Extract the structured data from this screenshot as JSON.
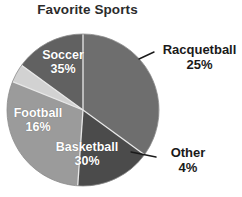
{
  "chart_data": {
    "type": "pie",
    "title": "Favorite Sports",
    "xlabel": "",
    "ylabel": "",
    "legend": "none",
    "grid": false,
    "categories": [
      "Soccer",
      "Racquetball",
      "Other",
      "Basketball",
      "Football"
    ],
    "values": [
      35,
      25,
      4,
      30,
      16
    ],
    "value_unit": "%",
    "slices": [
      {
        "name": "Soccer",
        "value": 35,
        "label": "Soccer",
        "percent_label": "35%",
        "color": "#6e6e6e",
        "label_color": "#ffffff",
        "label_placement": "inside",
        "start_angle": 0,
        "end_angle": 126
      },
      {
        "name": "Racquetball",
        "value": 25,
        "label": "Racquetball",
        "percent_label": "25%",
        "color": "#616161",
        "label_color": "#1a1a1a",
        "label_placement": "outside",
        "start_angle": 306,
        "end_angle": 360
      },
      {
        "name": "Other",
        "value": 4,
        "label": "Other",
        "percent_label": "4%",
        "color": "#d2d2d2",
        "label_color": "#1a1a1a",
        "label_placement": "outside",
        "start_angle": 292,
        "end_angle": 306
      },
      {
        "name": "Basketball",
        "value": 30,
        "label": "Basketball",
        "percent_label": "30%",
        "color": "#9b9b9b",
        "label_color": "#ffffff",
        "label_placement": "inside",
        "start_angle": 184,
        "end_angle": 292
      },
      {
        "name": "Football",
        "value": 16,
        "label": "Football",
        "percent_label": "16%",
        "color": "#4b4b4b",
        "label_color": "#ffffff",
        "label_placement": "inside",
        "start_angle": 126,
        "end_angle": 184
      }
    ],
    "geometry": {
      "center_x": 83,
      "center_y": 110,
      "radius": 76
    },
    "leader_lines": [
      {
        "for": "Racquetball",
        "x1": 139,
        "y1": 59,
        "x2": 154,
        "y2": 52
      },
      {
        "for": "Other",
        "x1": 131,
        "y1": 152,
        "x2": 156,
        "y2": 157
      }
    ]
  }
}
